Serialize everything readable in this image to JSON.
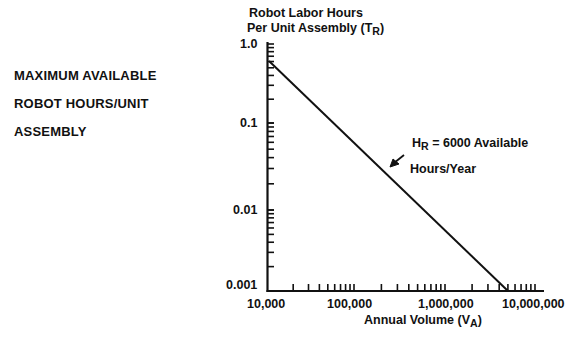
{
  "side_label": {
    "lines": [
      "MAXIMUM AVAILABLE",
      "ROBOT HOURS/UNIT",
      "ASSEMBLY"
    ]
  },
  "y_axis": {
    "title_line1": "Robot Labor Hours",
    "title_line2_main": "Per Unit Assembly (T",
    "title_line2_sub": "R",
    "title_line2_end": ")",
    "ticks": [
      "1.0",
      "0.1",
      "0.01",
      "0.001"
    ]
  },
  "x_axis": {
    "title_main": "Annual Volume (V",
    "title_sub": "A",
    "title_end": ")",
    "ticks": [
      "10,000",
      "100,000",
      "1,000,000",
      "10,000,000"
    ]
  },
  "annotation": {
    "line1_main": "H",
    "line1_sub": "R",
    "line1_rest": " = 6000 Available",
    "line2": "Hours/Year"
  },
  "chart_data": {
    "type": "line",
    "title": "",
    "xlabel": "Annual Volume (V_A)",
    "ylabel": "Robot Labor Hours Per Unit Assembly (T_R)",
    "xscale": "log",
    "yscale": "log",
    "xlim": [
      10000,
      10000000
    ],
    "ylim": [
      0.001,
      1.0
    ],
    "x_tick_labels": [
      "10,000",
      "100,000",
      "1,000,000",
      "10,000,000"
    ],
    "y_tick_labels": [
      "1.0",
      "0.1",
      "0.01",
      "0.001"
    ],
    "grid": false,
    "legend": null,
    "series": [
      {
        "name": "H_R = 6000 Available Hours/Year",
        "x": [
          10000,
          100000,
          1000000,
          6000000
        ],
        "y": [
          0.6,
          0.06,
          0.006,
          0.001
        ]
      }
    ],
    "annotations": [
      "H_R = 6000 Available Hours/Year",
      "MAXIMUM AVAILABLE ROBOT HOURS/UNIT ASSEMBLY"
    ]
  }
}
